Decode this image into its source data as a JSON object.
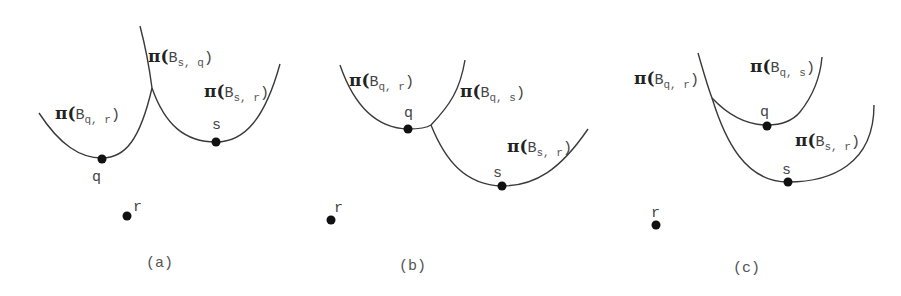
{
  "panels": [
    {
      "caption": "(a)",
      "points": {
        "q": "q",
        "s": "s",
        "r": "r"
      },
      "labels": [
        {
          "pi": "π(",
          "base": "B",
          "sub": "q, r",
          "close": ")"
        },
        {
          "pi": "π(",
          "base": "B",
          "sub": "s, q",
          "close": ")"
        },
        {
          "pi": "π(",
          "base": "B",
          "sub": "s, r",
          "close": ")"
        }
      ]
    },
    {
      "caption": "(b)",
      "points": {
        "q": "q",
        "s": "s",
        "r": "r"
      },
      "labels": [
        {
          "pi": "π(",
          "base": "B",
          "sub": "q, r",
          "close": ")"
        },
        {
          "pi": "π(",
          "base": "B",
          "sub": "q, s",
          "close": ")"
        },
        {
          "pi": "π(",
          "base": "B",
          "sub": "s, r",
          "close": ")"
        }
      ]
    },
    {
      "caption": "(c)",
      "points": {
        "q": "q",
        "s": "s",
        "r": "r"
      },
      "labels": [
        {
          "pi": "π(",
          "base": "B",
          "sub": "q, r",
          "close": ")"
        },
        {
          "pi": "π(",
          "base": "B",
          "sub": "q, s",
          "close": ")"
        },
        {
          "pi": "π(",
          "base": "B",
          "sub": "s, r",
          "close": ")"
        }
      ]
    }
  ]
}
